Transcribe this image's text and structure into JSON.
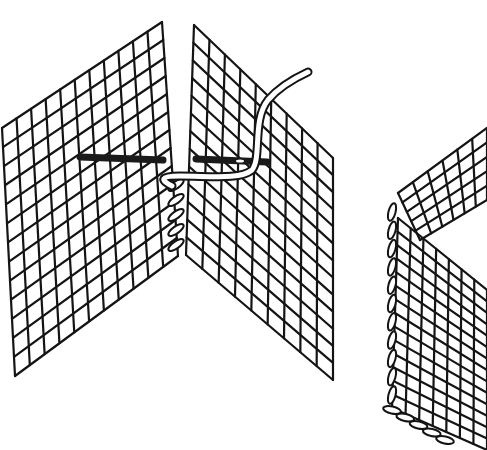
{
  "illustration": {
    "title": "",
    "description": "Joining two canvas mesh pieces with an overcast stitch; needle and yarn shown, plus a finished box corner",
    "colors": {
      "ink": "#141414",
      "paper": "#ffffff"
    }
  },
  "panels": [
    {
      "name": "left-canvas-panel",
      "corners": {
        "tl": [
          2,
          128
        ],
        "tr": [
          162,
          22
        ],
        "br": [
          178,
          256
        ],
        "bl": [
          15,
          376
        ]
      },
      "cols": 11,
      "rows": 13
    },
    {
      "name": "right-canvas-panel",
      "corners": {
        "tl": [
          194,
          25
        ],
        "tr": [
          333,
          158
        ],
        "br": [
          333,
          380
        ],
        "bl": [
          186,
          255
        ]
      },
      "cols": 9,
      "rows": 13
    },
    {
      "name": "box-top-panel",
      "corners": {
        "tl": [
          398,
          193
        ],
        "tr": [
          487,
          128
        ],
        "br": [
          487,
          200
        ],
        "bl": [
          420,
          240
        ]
      },
      "cols": 6,
      "rows": 5
    },
    {
      "name": "box-side-panel",
      "corners": {
        "tl": [
          398,
          218
        ],
        "tr": [
          487,
          290
        ],
        "br": [
          487,
          450
        ],
        "bl": [
          392,
          408
        ]
      },
      "cols": 7,
      "rows": 14
    }
  ],
  "needles": [
    {
      "name": "needle-left-segment",
      "from": [
        80,
        157
      ],
      "to": [
        163,
        160
      ]
    },
    {
      "name": "needle-right-segment",
      "from": [
        196,
        159
      ],
      "to": [
        267,
        162
      ]
    }
  ],
  "stitches": {
    "join_seam": {
      "x": 176,
      "y_start": 185,
      "y_end": 245,
      "count": 5
    },
    "box_edge": {
      "x": 392,
      "y_start": 212,
      "y_end": 395,
      "count": 11
    },
    "box_bottom": {
      "x_start": 392,
      "x_end": 445,
      "y_start": 410,
      "y_end": 440,
      "count": 5
    }
  }
}
